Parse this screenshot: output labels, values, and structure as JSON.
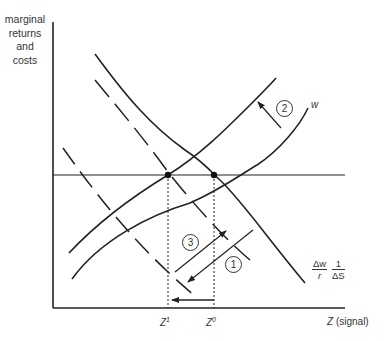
{
  "diagram": {
    "y_axis_label": [
      "marginal",
      "returns",
      "and",
      "costs"
    ],
    "x_axis_label": "Z (signal)",
    "x_axis_label_var": "Z",
    "x_axis_label_unit": "(signal)",
    "ticks": [
      {
        "base": "Z",
        "sup": "1"
      },
      {
        "base": "Z",
        "sup": "0"
      }
    ],
    "curve_labels": {
      "w": "w",
      "marginal_cost_num_left": "Δw",
      "marginal_cost_den_left": "r",
      "marginal_cost_num_right": "1",
      "marginal_cost_den_right": "ΔS"
    },
    "markers": [
      "1",
      "2",
      "3"
    ],
    "colors": {
      "line": "#222222",
      "background": "#ffffff"
    }
  }
}
